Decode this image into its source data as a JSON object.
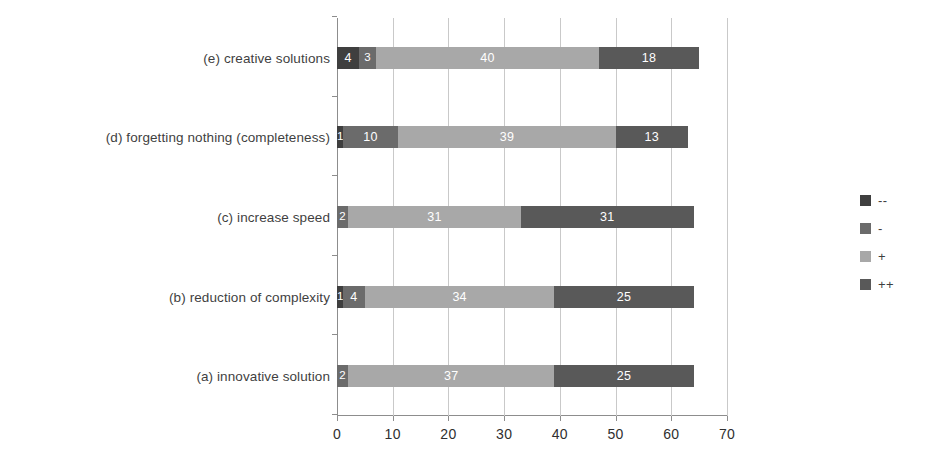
{
  "chart_data": {
    "type": "bar",
    "orientation": "horizontal",
    "stacked": true,
    "title": "",
    "xlabel": "",
    "ylabel": "",
    "xlim": [
      0,
      70
    ],
    "xticks": [
      0,
      10,
      20,
      30,
      40,
      50,
      60,
      70
    ],
    "grid": true,
    "legend_position": "right",
    "categories": [
      "(a) innovative solution",
      "(b) reduction of complexity",
      "(c) increase speed",
      "(d) forgetting nothing (completeness)",
      "(e) creative solutions"
    ],
    "series": [
      {
        "name": "--",
        "color": "#3f3f3f",
        "values": [
          0,
          1,
          0,
          1,
          4
        ]
      },
      {
        "name": "-",
        "color": "#6b6b6b",
        "values": [
          2,
          4,
          2,
          10,
          3
        ]
      },
      {
        "name": "+",
        "color": "#a8a8a8",
        "values": [
          37,
          34,
          31,
          39,
          40
        ]
      },
      {
        "name": "++",
        "color": "#595959",
        "values": [
          25,
          25,
          31,
          13,
          18
        ]
      }
    ],
    "totals": [
      64,
      64,
      64,
      63,
      65
    ],
    "bar_labels": {
      "(a) innovative solution": [
        "",
        "2",
        "37",
        "25"
      ],
      "(b) reduction of complexity": [
        "1",
        "4",
        "34",
        "25"
      ],
      "(c) increase speed": [
        "",
        "2",
        "31",
        "31"
      ],
      "(d) forgetting nothing (completeness)": [
        "1",
        "10",
        "39",
        "13"
      ],
      "(e) creative solutions": [
        "4",
        "3",
        "40",
        "18"
      ]
    }
  },
  "legend": {
    "items": [
      {
        "label": "--",
        "color": "#3f3f3f"
      },
      {
        "label": "-",
        "color": "#6b6b6b"
      },
      {
        "label": "+",
        "color": "#a8a8a8"
      },
      {
        "label": "++",
        "color": "#595959"
      }
    ]
  },
  "axis": {
    "x_tick_labels": [
      "0",
      "10",
      "20",
      "30",
      "40",
      "50",
      "60",
      "70"
    ]
  }
}
